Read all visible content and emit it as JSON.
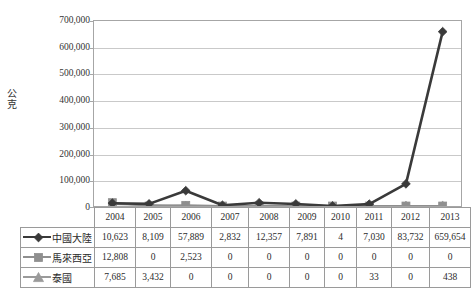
{
  "chart_data": {
    "type": "line",
    "title": "",
    "xlabel": "",
    "ylabel": "公克",
    "ylim": [
      0,
      700000
    ],
    "ytick_values": [
      700000,
      600000,
      500000,
      400000,
      300000,
      200000,
      100000,
      0
    ],
    "ytick_labels": [
      "700,000",
      "600,000",
      "500,000",
      "400,000",
      "300,000",
      "200,000",
      "100,000",
      "0"
    ],
    "grid": true,
    "legend_position": "table-left-column",
    "categories": [
      "2004",
      "2005",
      "2006",
      "2007",
      "2008",
      "2009",
      "2010",
      "2011",
      "2012",
      "2013"
    ],
    "series": [
      {
        "name": "中國大陸",
        "marker": "diamond",
        "color": "#3a3a3a",
        "values": [
          10623,
          8109,
          57889,
          2832,
          12357,
          7891,
          4,
          7030,
          83732,
          659654
        ],
        "labels": [
          "10,623",
          "8,109",
          "57,889",
          "2,832",
          "12,357",
          "7,891",
          "4",
          "7,030",
          "83,732",
          "659,654"
        ]
      },
      {
        "name": "馬來西亞",
        "marker": "square",
        "color": "#8f8f8f",
        "values": [
          12808,
          0,
          2523,
          0,
          0,
          0,
          0,
          0,
          0,
          0
        ],
        "labels": [
          "12,808",
          "0",
          "2,523",
          "0",
          "0",
          "0",
          "0",
          "0",
          "0",
          "0"
        ]
      },
      {
        "name": "泰國",
        "marker": "triangle",
        "color": "#9a9a9a",
        "values": [
          7685,
          3432,
          0,
          0,
          0,
          0,
          0,
          33,
          0,
          438
        ],
        "labels": [
          "7,685",
          "3,432",
          "0",
          "0",
          "0",
          "0",
          "0",
          "33",
          "0",
          "438"
        ]
      }
    ]
  },
  "colors": {
    "series_china": "#3a3a3a",
    "series_malaysia": "#8f8f8f",
    "series_thailand": "#9a9a9a",
    "gridline": "#c9c9c9",
    "frame": "#a6a6a6",
    "table_border": "#9a9a9a"
  }
}
